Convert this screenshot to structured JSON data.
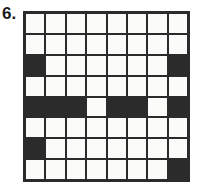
{
  "figure": {
    "label": "6.",
    "type": "grid-pattern",
    "rows": 8,
    "cols": 8,
    "colors": {
      "filled": "#2b2b2b",
      "empty": "#fbfbf9",
      "line": "#2b2b2b",
      "label": "#1a1a1a"
    },
    "grid": [
      [
        0,
        0,
        0,
        0,
        0,
        0,
        0,
        0
      ],
      [
        0,
        0,
        0,
        0,
        0,
        0,
        0,
        0
      ],
      [
        1,
        0,
        0,
        0,
        0,
        0,
        0,
        1
      ],
      [
        0,
        0,
        0,
        0,
        0,
        0,
        0,
        0
      ],
      [
        1,
        1,
        1,
        0,
        1,
        1,
        0,
        1
      ],
      [
        0,
        0,
        0,
        0,
        0,
        0,
        0,
        0
      ],
      [
        1,
        0,
        0,
        0,
        0,
        0,
        0,
        0
      ],
      [
        0,
        0,
        0,
        0,
        0,
        0,
        0,
        1
      ]
    ]
  }
}
